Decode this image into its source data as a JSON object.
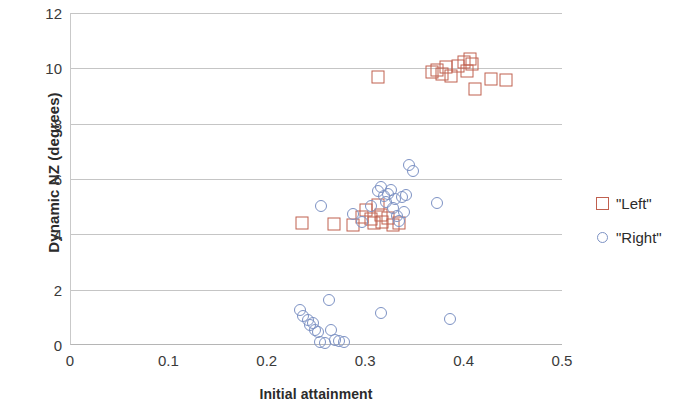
{
  "chart_data": {
    "type": "scatter",
    "title": "",
    "xlabel": "Initial attainment",
    "ylabel": "Dynamic NZ (degrees)",
    "xlim": [
      0,
      0.5
    ],
    "ylim": [
      0,
      12
    ],
    "xticks": [
      "0",
      "0.1",
      "0.2",
      "0.3",
      "0.4",
      "0.5"
    ],
    "xtick_values": [
      0,
      0.1,
      0.2,
      0.3,
      0.4,
      0.5
    ],
    "yticks": [
      "0",
      "2",
      "4",
      "6",
      "8",
      "10",
      "12"
    ],
    "ytick_values": [
      0,
      2,
      4,
      6,
      8,
      10,
      12
    ],
    "grid": "horizontal",
    "legend_position": "right",
    "colors": {
      "left": "#c0604f",
      "right": "#7d92c4",
      "gridline": "#c5c5c5",
      "axis": "#b5b5b5",
      "text": "#2b2b2b"
    },
    "series": [
      {
        "name": "\"Left\"",
        "marker": "open-square",
        "color": "#c0604f",
        "points": [
          [
            0.235,
            4.42
          ],
          [
            0.267,
            4.38
          ],
          [
            0.287,
            4.35
          ],
          [
            0.296,
            4.62
          ],
          [
            0.3,
            4.88
          ],
          [
            0.305,
            4.55
          ],
          [
            0.308,
            4.4
          ],
          [
            0.312,
            5.05
          ],
          [
            0.315,
            4.7
          ],
          [
            0.316,
            4.45
          ],
          [
            0.322,
            4.6
          ],
          [
            0.327,
            4.35
          ],
          [
            0.333,
            4.4
          ],
          [
            0.312,
            9.68
          ],
          [
            0.367,
            9.88
          ],
          [
            0.372,
            9.95
          ],
          [
            0.377,
            9.78
          ],
          [
            0.381,
            10.05
          ],
          [
            0.386,
            9.72
          ],
          [
            0.393,
            10.08
          ],
          [
            0.399,
            10.22
          ],
          [
            0.402,
            9.92
          ],
          [
            0.405,
            10.35
          ],
          [
            0.408,
            10.15
          ],
          [
            0.411,
            9.25
          ],
          [
            0.427,
            9.62
          ],
          [
            0.442,
            9.58
          ]
        ]
      },
      {
        "name": "\"Right\"",
        "marker": "open-circle",
        "color": "#7d92c4",
        "points": [
          [
            0.233,
            1.28
          ],
          [
            0.236,
            1.05
          ],
          [
            0.241,
            0.92
          ],
          [
            0.243,
            0.72
          ],
          [
            0.246,
            0.8
          ],
          [
            0.248,
            0.55
          ],
          [
            0.251,
            0.48
          ],
          [
            0.253,
            0.12
          ],
          [
            0.258,
            0.08
          ],
          [
            0.262,
            1.62
          ],
          [
            0.264,
            0.55
          ],
          [
            0.268,
            0.18
          ],
          [
            0.272,
            0.15
          ],
          [
            0.277,
            0.12
          ],
          [
            0.254,
            5.02
          ],
          [
            0.287,
            4.72
          ],
          [
            0.296,
            4.45
          ],
          [
            0.305,
            5.02
          ],
          [
            0.312,
            5.55
          ],
          [
            0.315,
            5.72
          ],
          [
            0.318,
            5.38
          ],
          [
            0.32,
            5.18
          ],
          [
            0.322,
            5.45
          ],
          [
            0.325,
            5.62
          ],
          [
            0.327,
            4.95
          ],
          [
            0.329,
            5.28
          ],
          [
            0.331,
            4.68
          ],
          [
            0.333,
            4.48
          ],
          [
            0.336,
            5.35
          ],
          [
            0.338,
            4.82
          ],
          [
            0.34,
            5.42
          ],
          [
            0.343,
            6.52
          ],
          [
            0.348,
            6.28
          ],
          [
            0.315,
            1.15
          ],
          [
            0.385,
            0.95
          ],
          [
            0.372,
            5.15
          ]
        ]
      }
    ]
  },
  "legend": {
    "items": [
      {
        "label": "\"Left\"",
        "marker": "square",
        "color": "#c0604f"
      },
      {
        "label": "\"Right\"",
        "marker": "circle",
        "color": "#7d92c4"
      }
    ]
  }
}
